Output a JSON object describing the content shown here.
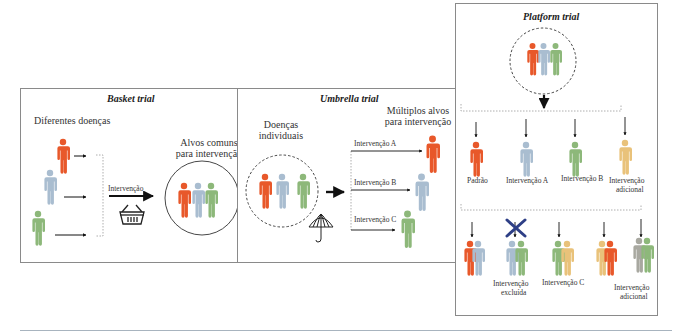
{
  "colors": {
    "orange": "#E8582A",
    "blue": "#A9BDD0",
    "green": "#8DB87A",
    "yellow": "#E9C27A",
    "gray": "#A8A8A0",
    "cross": "#2E3F86",
    "border": "#8a8a8a"
  },
  "basket": {
    "title": "Basket trial",
    "left_label": "Diferentes doenças",
    "arrow_label": "Intervenção",
    "right_label_line1": "Alvos comuns",
    "right_label_line2": "para intervenção",
    "icon": "basket-icon"
  },
  "umbrella": {
    "title": "Umbrella trial",
    "left_label_line1": "Doenças",
    "left_label_line2": "individuais",
    "right_label_line1": "Múltiplos alvos",
    "right_label_line2": "para intervenção",
    "branches": [
      {
        "label": "Intervenção A",
        "color": "orange"
      },
      {
        "label": "Intervenção B",
        "color": "blue"
      },
      {
        "label": "Intervenção C",
        "color": "green"
      }
    ],
    "icon": "umbrella-icon"
  },
  "platform": {
    "title": "Platform trial",
    "row1": [
      {
        "label": "Padrão",
        "color": "orange"
      },
      {
        "label": "Intervenção A",
        "color": "blue"
      },
      {
        "label": "Intervenção B",
        "color": "green"
      },
      {
        "label_line1": "Intervenção",
        "label_line2": "adicional",
        "color": "yellow"
      }
    ],
    "row2": [
      {
        "label": "",
        "colors": [
          "orange",
          "blue"
        ]
      },
      {
        "label_line1": "Intervenção",
        "label_line2": "excluída",
        "colors": [
          "blue",
          "green"
        ],
        "excluded": true
      },
      {
        "label": "Intervenção C",
        "colors": [
          "green",
          "yellow"
        ]
      },
      {
        "label": "",
        "colors": [
          "yellow",
          "orange"
        ]
      },
      {
        "label_line1": "Intervenção",
        "label_line2": "adicional",
        "colors": [
          "gray",
          "green"
        ]
      }
    ]
  }
}
